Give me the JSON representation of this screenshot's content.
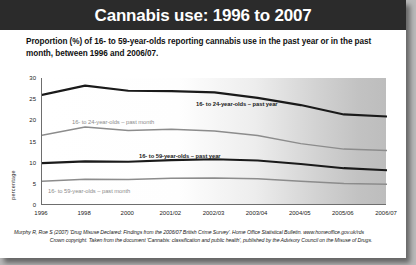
{
  "header": {
    "title": "Cannabis use: 1996 to 2007"
  },
  "subtitle": "Proportion (%) of 16- to 59-year-olds reporting cannabis use in the past year or in the past month, between 1996 and 2006/07.",
  "footnote": {
    "line1": "Murphy R, Roe S (2007) 'Drug Misuse Declared: Findings from the 2006/07 British Crime Survey'. Home Office Statistical Bulletin. www.homeoffice.gov.uk/rds",
    "line2": "Crown copyright. Taken from the document 'Cannabis: classification and public health', published by the Advisory Council on the Misuse of Drugs."
  },
  "colors": {
    "title_bar": "#2b2b2b",
    "series_dark": "#1a1a1a",
    "series_gray": "#8c8c8c",
    "axis": "#6e6e6e"
  },
  "chart_data": {
    "type": "line",
    "title": "Cannabis use: 1996 to 2007",
    "xlabel": "",
    "ylabel": "percentage",
    "ylim": [
      0,
      30
    ],
    "yticks": [
      0,
      5,
      10,
      15,
      20,
      25,
      30
    ],
    "grid": false,
    "legend": "inline-labels",
    "categories": [
      "1996",
      "1998",
      "2000",
      "2001/02",
      "2002/03",
      "2003/04",
      "2004/05",
      "2005/06",
      "2006/07"
    ],
    "series": [
      {
        "name": "16- to 24-year-olds – past year",
        "color": "#1a1a1a",
        "style": "thick-dark",
        "values": [
          26.0,
          28.2,
          27.0,
          26.9,
          26.6,
          25.3,
          23.6,
          21.4,
          20.9
        ]
      },
      {
        "name": "16- to 24-year-olds – past month",
        "color": "#8c8c8c",
        "style": "medium-gray",
        "values": [
          16.5,
          18.4,
          17.6,
          17.9,
          17.5,
          16.4,
          14.5,
          13.2,
          12.9
        ]
      },
      {
        "name": "16- to 59-year-olds – past year",
        "color": "#1a1a1a",
        "style": "thick-dark",
        "values": [
          9.9,
          10.3,
          10.2,
          10.6,
          10.8,
          10.5,
          9.7,
          8.7,
          8.2
        ]
      },
      {
        "name": "16- to 59-year-olds – past month",
        "color": "#8c8c8c",
        "style": "medium-gray",
        "values": [
          5.6,
          6.1,
          6.0,
          6.3,
          6.4,
          6.2,
          5.6,
          5.1,
          4.9
        ]
      }
    ]
  }
}
